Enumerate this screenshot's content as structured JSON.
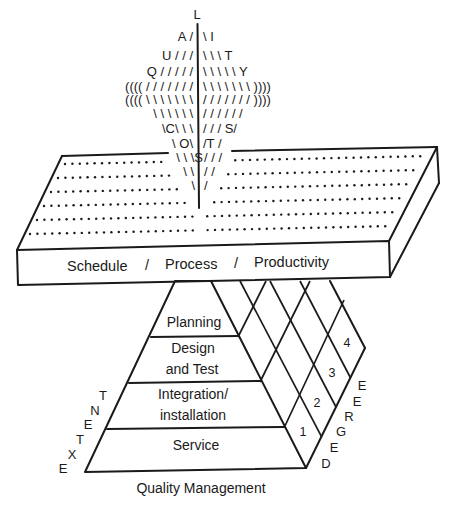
{
  "diagram": {
    "title": "Quality Management",
    "vertical_word": {
      "word": "QUALITY COSTS",
      "top_letter": "L"
    },
    "ascii_rows": [
      {
        "left": "",
        "right": "",
        "center": "L"
      },
      {
        "left": "A /",
        "right": "\\ I"
      },
      {
        "left": "U / / /",
        "right": "\\ \\ \\ T"
      },
      {
        "left": "Q / / / / /",
        "right": "\\ \\ \\ \\ \\ Y"
      },
      {
        "left": "(((( / / / / / / /",
        "right": "\\ \\ \\ \\ \\ \\ \\  ))))"
      },
      {
        "left": "(((( \\ \\ \\ \\ \\ \\ \\",
        "right": "/ / / / / / /  ))))"
      },
      {
        "left": "\\ \\ \\ \\ \\ \\",
        "right": "/ / / / / /"
      },
      {
        "left": "\\C\\ \\ \\",
        "right": "/ / / S/"
      },
      {
        "left": "\\ O\\",
        "right": "/T /"
      },
      {
        "left": "\\ \\ \\S",
        "right": "/ / /"
      },
      {
        "left": "\\ \\",
        "right": "/ /"
      },
      {
        "left": "\\",
        "right": "/"
      }
    ],
    "slab": {
      "label_parts": [
        "Schedule",
        "/",
        "Process",
        "/",
        "Productivity"
      ],
      "dotted_rows": 6
    },
    "pyramid": {
      "layers": [
        {
          "lines": [
            "Planning"
          ]
        },
        {
          "lines": [
            "Design",
            "and Test"
          ]
        },
        {
          "lines": [
            "Integration/",
            "installation"
          ]
        },
        {
          "lines": [
            "Service"
          ]
        }
      ],
      "degree_levels": [
        "1",
        "2",
        "3",
        "4"
      ],
      "left_axis_label": "EXTENT",
      "right_axis_label": "DEGREE",
      "left_axis_letters": [
        "E",
        "X",
        "T",
        "E",
        "N",
        "T"
      ],
      "right_axis_letters": [
        "D",
        "E",
        "G",
        "R",
        "E",
        "E"
      ]
    },
    "caption": "Quality Management"
  }
}
